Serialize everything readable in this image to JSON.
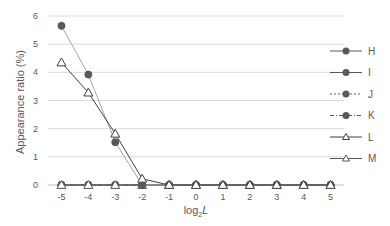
{
  "chart_data": {
    "type": "line",
    "title": "",
    "xlabel": "log2L",
    "xlabel_base": "log",
    "xlabel_sub": "2",
    "xlabel_var": "L",
    "ylabel": "Appearance ratio (%)",
    "x": [
      -5,
      -4,
      -3,
      -2,
      -1,
      0,
      1,
      2,
      3,
      4,
      5
    ],
    "x_tick_labels": [
      "-5",
      "-4",
      "-3",
      "-2",
      "-1",
      "0",
      "1",
      "2",
      "3",
      "4",
      "5"
    ],
    "ylim": [
      0,
      6
    ],
    "y_ticks": [
      0,
      1,
      2,
      3,
      4,
      5,
      6
    ],
    "grid": true,
    "legend_position": "right",
    "series": [
      {
        "name": "H",
        "marker": "circle",
        "line": "solid",
        "color": "#595959",
        "values": [
          5.65,
          3.92,
          1.52,
          0.0,
          0.0,
          0.0,
          0.0,
          0.0,
          0.0,
          0.0,
          0.0
        ]
      },
      {
        "name": "I",
        "marker": "circle",
        "line": "solid",
        "color": "#595959",
        "values": [
          0.0,
          0.0,
          0.0,
          0.0,
          0.0,
          0.0,
          0.0,
          0.0,
          0.0,
          0.0,
          0.0
        ]
      },
      {
        "name": "J",
        "marker": "circle",
        "line": "dotted",
        "color": "#595959",
        "values": [
          0.0,
          0.0,
          0.0,
          0.0,
          0.0,
          0.0,
          0.0,
          0.0,
          0.0,
          0.0,
          0.0
        ]
      },
      {
        "name": "K",
        "marker": "circle",
        "line": "dashdot",
        "color": "#595959",
        "values": [
          0.0,
          0.0,
          0.0,
          0.0,
          0.0,
          0.0,
          0.0,
          0.0,
          0.0,
          0.0,
          0.0
        ]
      },
      {
        "name": "L",
        "marker": "triangle-open",
        "line": "solid",
        "color": "#404040",
        "values": [
          4.35,
          3.28,
          1.82,
          0.22,
          0.0,
          0.0,
          0.0,
          0.0,
          0.0,
          0.0,
          0.0
        ]
      },
      {
        "name": "M",
        "marker": "triangle",
        "line": "solid",
        "color": "#595959",
        "values": [
          0.0,
          0.0,
          0.0,
          0.0,
          0.0,
          0.0,
          0.0,
          0.0,
          0.0,
          0.0,
          0.0
        ]
      }
    ]
  }
}
